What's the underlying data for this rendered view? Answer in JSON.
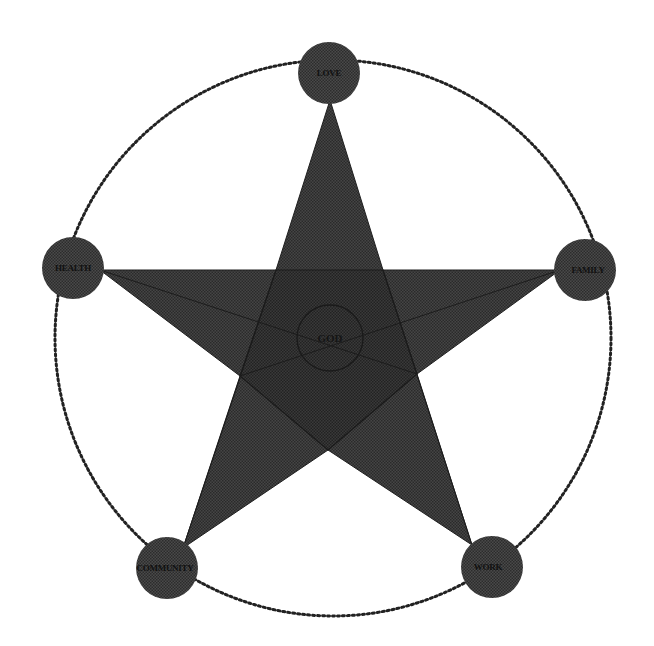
{
  "diagram": {
    "type": "star-of-life-values",
    "center": {
      "label": "GOD"
    },
    "nodes": [
      {
        "id": "love",
        "label": "LOVE",
        "position": "top"
      },
      {
        "id": "family",
        "label": "FAMILY",
        "position": "right"
      },
      {
        "id": "work",
        "label": "WORK",
        "position": "bottom-right"
      },
      {
        "id": "community",
        "label": "COMMUNITY",
        "position": "bottom-left"
      },
      {
        "id": "health",
        "label": "HEALTH",
        "position": "left"
      }
    ],
    "colors": {
      "background": "#ffffff",
      "star_fill": "#3c3c3c",
      "star_overlap_fill": "#333333",
      "node_fill": "#3a3a3a",
      "outer_ring": "#222222",
      "label_text": "#111111"
    }
  }
}
